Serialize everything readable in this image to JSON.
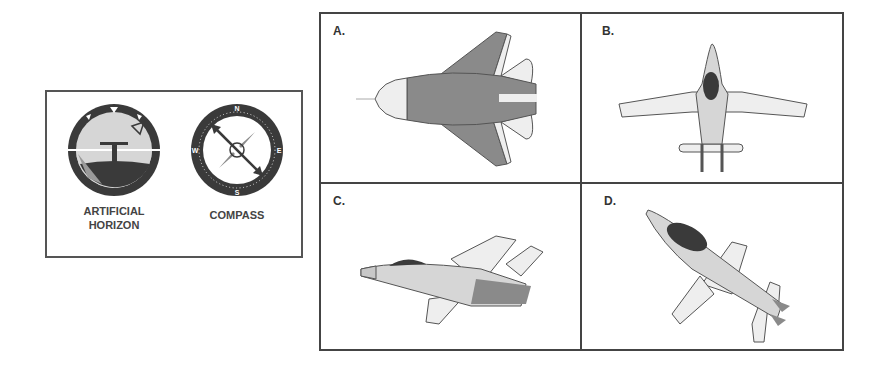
{
  "instruments": {
    "artificial_horizon": {
      "label_line1": "ARTIFICIAL",
      "label_line2": "HORIZON"
    },
    "compass": {
      "label": "COMPASS",
      "cardinals": [
        "N",
        "E",
        "S",
        "W"
      ]
    }
  },
  "options": [
    {
      "letter": "A.",
      "description": "jet viewed from above, nose pointing left"
    },
    {
      "letter": "B.",
      "description": "jet viewed from above, nose pointing up"
    },
    {
      "letter": "C.",
      "description": "jet banking, nose pointing left"
    },
    {
      "letter": "D.",
      "description": "jet diving toward lower right"
    }
  ],
  "colors": {
    "border": "#444444",
    "dark": "#3a3a3a",
    "mid": "#8a8a8a",
    "light": "#d8d8d8",
    "pale": "#efefef"
  }
}
